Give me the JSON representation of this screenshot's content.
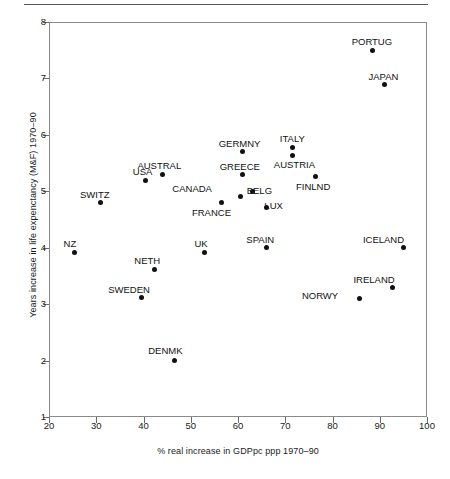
{
  "figure": {
    "top_rule": true,
    "plot_background": "#ffffff",
    "frame_color": "#8a8a8a",
    "point_color": "#111111"
  },
  "chart_data": {
    "type": "scatter",
    "title": "",
    "xlabel": "% real increase in GDPpc ppp 1970–90",
    "ylabel": "Years increase in life expenctancy (M&F) 1970–90",
    "xlim": [
      20,
      100
    ],
    "ylim": [
      1,
      8
    ],
    "xticks": [
      20,
      30,
      40,
      50,
      60,
      70,
      80,
      90,
      100
    ],
    "yticks": [
      1,
      2,
      3,
      4,
      5,
      6,
      7,
      8
    ],
    "grid": false,
    "legend": null,
    "points": [
      {
        "label": "PORTUG",
        "x": 88.5,
        "y": 7.5,
        "lx": -1,
        "ly": -13
      },
      {
        "label": "JAPAN",
        "x": 91.0,
        "y": 6.89,
        "lx": -1,
        "ly": -13
      },
      {
        "label": "GERMNY",
        "x": 61.0,
        "y": 5.7,
        "lx": -3,
        "ly": -13
      },
      {
        "label": "ITALY",
        "x": 71.5,
        "y": 5.77,
        "lx": 0,
        "ly": -14
      },
      {
        "label": "AUSTRIA",
        "x": 71.5,
        "y": 5.64,
        "lx": 2,
        "ly": 5
      },
      {
        "label": "AUSTRAL",
        "x": 44.0,
        "y": 5.3,
        "lx": -3,
        "ly": -13
      },
      {
        "label": "USA",
        "x": 40.5,
        "y": 5.2,
        "lx": -3,
        "ly": -13
      },
      {
        "label": "GREECE",
        "x": 61.0,
        "y": 5.29,
        "lx": -3,
        "ly": -13
      },
      {
        "label": "FINLND",
        "x": 76.5,
        "y": 5.27,
        "lx": -3,
        "ly": 6
      },
      {
        "label": "BELG",
        "x": 63.0,
        "y": 5.0,
        "lx": 7,
        "ly": -5
      },
      {
        "label": "CANADA",
        "x": 60.5,
        "y": 4.91,
        "lx": -48,
        "ly": -12
      },
      {
        "label": "FRANCE",
        "x": 56.5,
        "y": 4.81,
        "lx": -10,
        "ly": 6
      },
      {
        "label": "SWITZ",
        "x": 30.8,
        "y": 4.8,
        "lx": -5,
        "ly": -13
      },
      {
        "label": "LUX",
        "x": 66.0,
        "y": 4.72,
        "lx": 7,
        "ly": -6
      },
      {
        "label": "SPAIN",
        "x": 66.0,
        "y": 4.0,
        "lx": -6,
        "ly": -13
      },
      {
        "label": "ICELAND",
        "x": 95.0,
        "y": 4.0,
        "lx": -20,
        "ly": -13
      },
      {
        "label": "UK",
        "x": 53.0,
        "y": 3.92,
        "lx": -4,
        "ly": -13
      },
      {
        "label": "NZ",
        "x": 25.3,
        "y": 3.92,
        "lx": -4,
        "ly": -13
      },
      {
        "label": "NETH",
        "x": 42.3,
        "y": 3.62,
        "lx": -7,
        "ly": -13
      },
      {
        "label": "IRELAND",
        "x": 92.8,
        "y": 3.29,
        "lx": -19,
        "ly": -13
      },
      {
        "label": "SWEDEN",
        "x": 39.5,
        "y": 3.11,
        "lx": -12,
        "ly": -13
      },
      {
        "label": "NORWY",
        "x": 85.8,
        "y": 3.1,
        "lx": -40,
        "ly": -8
      },
      {
        "label": "DENMK",
        "x": 46.5,
        "y": 2.0,
        "lx": -9,
        "ly": -15
      }
    ]
  }
}
